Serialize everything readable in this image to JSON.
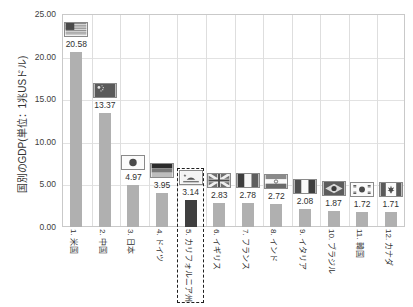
{
  "chart_data": {
    "type": "bar",
    "title": "",
    "xlabel": "",
    "ylabel": "国別のGDP(単位：1兆USドル)",
    "ylim": [
      0,
      25
    ],
    "ytick_step": 5,
    "ytick_labels": [
      "25.00",
      "20.00",
      "15.00",
      "10.00",
      "5.00",
      "0.00"
    ],
    "ytick_values": [
      25,
      20,
      15,
      10,
      5,
      0
    ],
    "grid": true,
    "legend": "none",
    "categories": [
      "1. 米国",
      "2. 中国",
      "3. 日本",
      "4. ドイツ",
      "5. カリフォルニア州",
      "6. イギリス",
      "7. フランス",
      "8. インド",
      "9. イタリア",
      "10. ブラジル",
      "11. 韓国",
      "12. カナダ"
    ],
    "values": [
      20.58,
      13.37,
      4.97,
      3.95,
      3.14,
      2.83,
      2.78,
      2.72,
      2.08,
      1.87,
      1.72,
      1.71
    ],
    "value_labels": [
      "20.58",
      "13.37",
      "4.97",
      "3.95",
      "3.14",
      "2.83",
      "2.78",
      "2.72",
      "2.08",
      "1.87",
      "1.72",
      "1.71"
    ],
    "flags": [
      "usa-flag-icon",
      "china-flag-icon",
      "japan-flag-icon",
      "germany-flag-icon",
      "california-flag-icon",
      "uk-flag-icon",
      "france-flag-icon",
      "india-flag-icon",
      "italy-flag-icon",
      "brazil-flag-icon",
      "south-korea-flag-icon",
      "canada-flag-icon"
    ],
    "highlight_index": 4,
    "colors": {
      "bar": "#b0b0b0",
      "bar_highlight": "#3f3f3f",
      "grid": "#e2e2e2",
      "axis": "#c9c9c9",
      "highlight_box": "#1f1f1f",
      "text": "#303030"
    }
  }
}
